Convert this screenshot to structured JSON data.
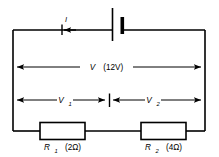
{
  "figure": {
    "kind": "series-circuit-diagram",
    "background_color": "#ffffff",
    "line_color": "#000000",
    "width": 219,
    "height": 157
  },
  "labels": {
    "current": "I",
    "total_voltage_symbol": "V",
    "total_voltage_value": "(12V)",
    "v1_symbol": "V",
    "v1_subscript": "1",
    "v2_symbol": "V",
    "v2_subscript": "2",
    "r1_symbol": "R",
    "r1_subscript": "1",
    "r1_value": "(2Ω)",
    "r2_symbol": "R",
    "r2_subscript": "2",
    "r2_value": "(4Ω)"
  },
  "components": {
    "battery": {
      "name": "battery",
      "polarity_long_side": "left",
      "polarity_short_side": "right"
    },
    "resistor_1": {
      "name": "R1",
      "resistance": "2Ω"
    },
    "resistor_2": {
      "name": "R2",
      "resistance": "4Ω"
    }
  },
  "measurements": [
    {
      "name": "V",
      "value": "12V",
      "span": "whole-circuit",
      "arrow": "double"
    },
    {
      "name": "V1",
      "value": "",
      "span": "left-half",
      "arrow": "double"
    },
    {
      "name": "V2",
      "value": "",
      "span": "right-half",
      "arrow": "double"
    }
  ],
  "current_flow": {
    "symbol": "I",
    "direction": "leftward-on-top-wire"
  }
}
